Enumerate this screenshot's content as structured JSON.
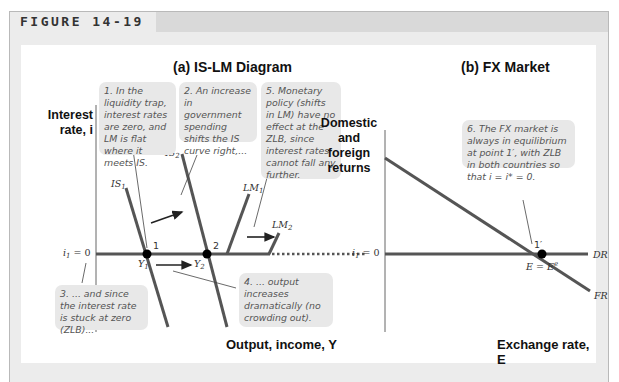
{
  "figure": {
    "label": "FIGURE 14-19"
  },
  "panel_a": {
    "title": "(a) IS-LM Diagram",
    "y_axis_label_line1": "Interest",
    "y_axis_label_line2": "rate, i",
    "x_axis_label": "Output, income, Y",
    "rate_label": "i",
    "rate_sub": "1",
    "rate_value": " = 0",
    "curves": {
      "IS1": {
        "name": "IS",
        "sub": "1"
      },
      "IS2": {
        "name": "IS",
        "sub": "2"
      },
      "LM1": {
        "name": "LM",
        "sub": "1"
      },
      "LM2": {
        "name": "LM",
        "sub": "2"
      }
    },
    "points": {
      "p1": "1",
      "p2": "2"
    },
    "outputs": {
      "Y1": {
        "name": "Y",
        "sub": "1"
      },
      "Y2": {
        "name": "Y",
        "sub": "2"
      }
    },
    "notes": [
      "1. In the liquidity trap, interest rates are zero, and LM is flat where it meets IS.",
      "2. An increase in government spending shifts the IS curve right,...",
      "3. ... and since the interest rate is stuck at zero (ZLB)...",
      "4. ... output increases dramatically (no crowding out).",
      "5. Monetary policy (shifts in LM) have no effect at the ZLB, since interest rates cannot fall any further."
    ]
  },
  "panel_b": {
    "title": "(b) FX Market",
    "y_axis_label_lines": [
      "Domestic",
      "and",
      "foreign",
      "returns"
    ],
    "x_axis_label": "Exchange rate, E",
    "rate_label": "i",
    "rate_sub": "1",
    "rate_value": " = 0",
    "curves": {
      "DR": "DR",
      "FR": "FR"
    },
    "point": "1′",
    "eq_label": "E = E",
    "eq_sup": "e",
    "note": "6. The FX market is always in equilibrium at point 1′, with ZLB in both countries so that i = i* = 0."
  },
  "colors": {
    "curve": "#555555",
    "panel_bg": "#ffffff",
    "frame_bg": "#ececec",
    "note_bg": "#e8e8e8"
  }
}
